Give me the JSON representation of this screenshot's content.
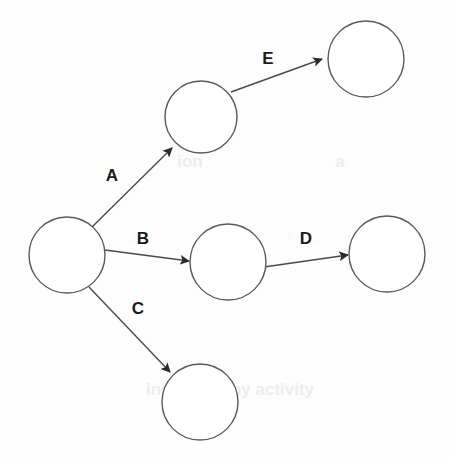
{
  "diagram": {
    "type": "directed-graph",
    "canvas": {
      "width": 450,
      "height": 460,
      "background": "#fdfdfd"
    },
    "style": {
      "node_stroke": "#5a5a5a",
      "node_fill": "#ffffff",
      "edge_stroke": "#4a4a4a",
      "label_color": "#1a1a1a",
      "arrow_fill": "#2b2b2b"
    },
    "nodes": [
      {
        "id": "n1",
        "label": "",
        "cx": 67,
        "cy": 255,
        "r": 38
      },
      {
        "id": "n2",
        "label": "",
        "cx": 201,
        "cy": 117,
        "r": 36
      },
      {
        "id": "n3",
        "label": "",
        "cx": 366,
        "cy": 59,
        "r": 38
      },
      {
        "id": "n4",
        "label": "",
        "cx": 228,
        "cy": 262,
        "r": 38
      },
      {
        "id": "n5",
        "label": "",
        "cx": 387,
        "cy": 254,
        "r": 38
      },
      {
        "id": "n6",
        "label": "",
        "cx": 200,
        "cy": 402,
        "r": 38
      }
    ],
    "edges": [
      {
        "id": "eA",
        "label": "A",
        "from": "n1",
        "to": "n2",
        "x1": 92,
        "y1": 227,
        "x2": 172,
        "y2": 148,
        "label_x": 112,
        "label_y": 177
      },
      {
        "id": "eB",
        "label": "B",
        "from": "n1",
        "to": "n4",
        "x1": 105,
        "y1": 250,
        "x2": 189,
        "y2": 261,
        "label_x": 143,
        "label_y": 240
      },
      {
        "id": "eC",
        "label": "C",
        "from": "n1",
        "to": "n6",
        "x1": 89,
        "y1": 287,
        "x2": 170,
        "y2": 372,
        "label_x": 138,
        "label_y": 310
      },
      {
        "id": "eD",
        "label": "D",
        "from": "n4",
        "to": "n5",
        "x1": 264,
        "y1": 267,
        "x2": 348,
        "y2": 255,
        "label_x": 306,
        "label_y": 240
      },
      {
        "id": "eE",
        "label": "E",
        "from": "n2",
        "to": "n3",
        "x1": 231,
        "y1": 92,
        "x2": 322,
        "y2": 59,
        "label_x": 268,
        "label_y": 60
      }
    ],
    "bleed_artifacts": [
      {
        "text": "ion",
        "x": 190,
        "y": 163
      },
      {
        "text": "a",
        "x": 340,
        "y": 163
      },
      {
        "text": "ing a dummy activity",
        "x": 230,
        "y": 391
      }
    ]
  }
}
